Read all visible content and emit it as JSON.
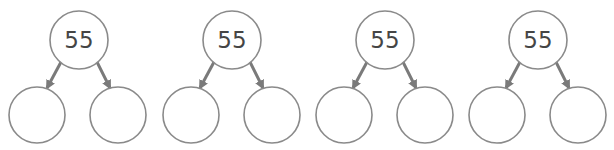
{
  "diagram": {
    "type": "number-bond-trees",
    "colors": {
      "node_stroke": "#8a8a8a",
      "edge": "#7a7a7a",
      "text": "#454545",
      "background": "#ffffff"
    },
    "trees": [
      {
        "root": {
          "label": "55",
          "cx": 79,
          "cy": 40
        },
        "children": [
          {
            "label": "",
            "cx": 37,
            "cy": 115
          },
          {
            "label": "",
            "cx": 118,
            "cy": 115
          }
        ]
      },
      {
        "root": {
          "label": "55",
          "cx": 232,
          "cy": 40
        },
        "children": [
          {
            "label": "",
            "cx": 191,
            "cy": 115
          },
          {
            "label": "",
            "cx": 272,
            "cy": 115
          }
        ]
      },
      {
        "root": {
          "label": "55",
          "cx": 385,
          "cy": 40
        },
        "children": [
          {
            "label": "",
            "cx": 344,
            "cy": 115
          },
          {
            "label": "",
            "cx": 425,
            "cy": 115
          }
        ]
      },
      {
        "root": {
          "label": "55",
          "cx": 538,
          "cy": 40
        },
        "children": [
          {
            "label": "",
            "cx": 497,
            "cy": 115
          },
          {
            "label": "",
            "cx": 578,
            "cy": 115
          }
        ]
      }
    ]
  }
}
